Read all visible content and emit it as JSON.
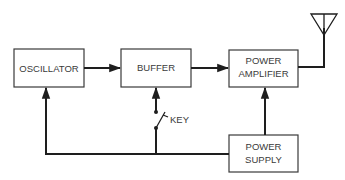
{
  "diagram": {
    "title": "",
    "blocks": {
      "oscillator": {
        "label": "OSCILLATOR"
      },
      "buffer": {
        "label": "BUFFER"
      },
      "power_amplifier": {
        "line1": "POWER",
        "line2": "AMPLIFIER"
      },
      "power_supply": {
        "line1": "POWER",
        "line2": "SUPPLY"
      }
    },
    "key": {
      "label": "KEY"
    },
    "antenna": {
      "icon": "antenna-icon"
    },
    "connections": [
      {
        "from": "oscillator",
        "to": "buffer",
        "type": "arrow"
      },
      {
        "from": "buffer",
        "to": "power_amplifier",
        "type": "arrow"
      },
      {
        "from": "power_amplifier",
        "to": "antenna",
        "type": "line"
      },
      {
        "from": "power_supply",
        "to": "power_amplifier",
        "type": "arrow"
      },
      {
        "from": "power_supply",
        "to": "oscillator",
        "type": "arrow"
      },
      {
        "from": "power_supply",
        "to": "buffer",
        "via": "key",
        "type": "arrow"
      }
    ]
  }
}
